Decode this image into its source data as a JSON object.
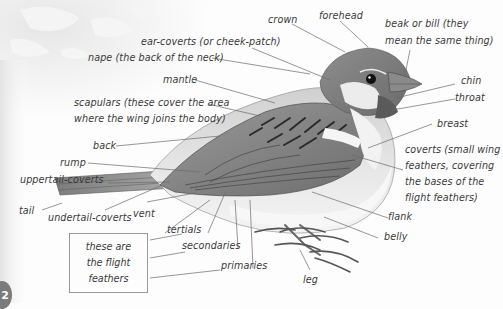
{
  "diagram": {
    "page_number": "2",
    "labels": {
      "crown": "crown",
      "forehead": "forehead",
      "beak_line1": "beak or bill  (they",
      "beak_line2": "mean the same thing)",
      "ear_coverts": "ear-coverts (or cheek-patch)",
      "nape": "nape (the back of the neck)",
      "mantle": "mantle",
      "chin": "chin",
      "throat": "throat",
      "scapulars_line1": "scapulars (these cover the area",
      "scapulars_line2": "where the wing joins the body)",
      "breast": "breast",
      "back": "back",
      "coverts_line1": "coverts (small wing",
      "coverts_line2": "feathers, covering",
      "coverts_line3": "the bases of the",
      "coverts_line4": "flight feathers)",
      "rump": "rump",
      "uppertail_coverts": "uppertail-coverts",
      "tail": "tail",
      "undertail_coverts": "undertail-coverts",
      "vent": "vent",
      "tertials": "tertials",
      "flank": "flank",
      "secondaries": "secondaries",
      "belly": "belly",
      "primaries": "primaries",
      "leg": "leg"
    },
    "flight_box": {
      "line1": "these are",
      "line2": "the flight",
      "line3": "feathers"
    },
    "colors": {
      "line": "#6a6a6a",
      "text": "#3a3a3a",
      "box_border": "#9a9a9a",
      "page_badge": "#7b7b7b"
    }
  }
}
